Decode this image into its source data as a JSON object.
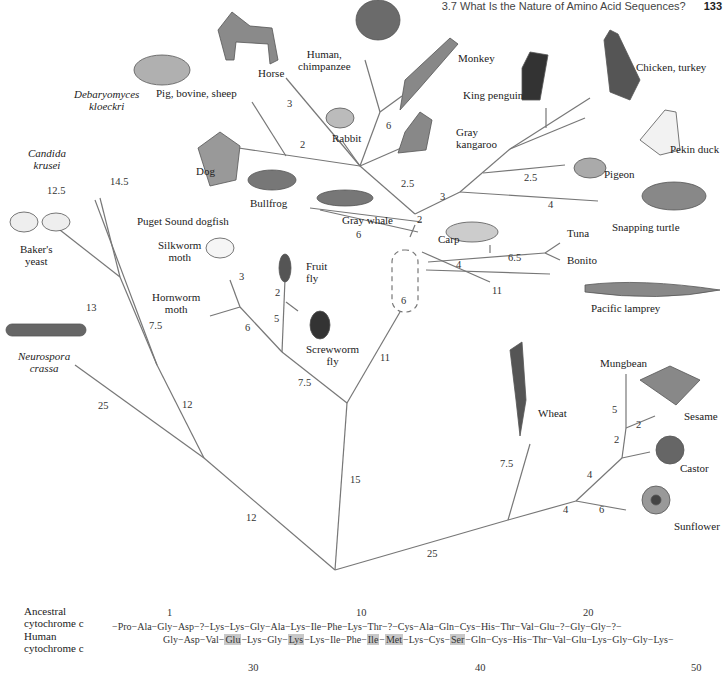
{
  "header": {
    "section": "3.7  What Is the Nature of Amino Acid Sequences?",
    "page": "133"
  },
  "organisms": {
    "horse": "Horse",
    "human": "Human,\nchimpanzee",
    "human_l1": "Human,",
    "human_l2": "chimpanzee",
    "monkey": "Monkey",
    "pig": "Pig, bovine, sheep",
    "rabbit": "Rabbit",
    "kangaroo_l1": "Gray",
    "kangaroo_l2": "kangaroo",
    "king_penguin": "King penguin",
    "chicken": "Chicken, turkey",
    "duck": "Pekin duck",
    "pigeon": "Pigeon",
    "turtle": "Snapping turtle",
    "dog": "Dog",
    "bullfrog": "Bullfrog",
    "whale": "Gray whale",
    "dogfish": "Puget Sound dogfish",
    "carp": "Carp",
    "tuna": "Tuna",
    "bonito": "Bonito",
    "lamprey": "Pacific lamprey",
    "silkworm_l1": "Silkworm",
    "silkworm_l2": "moth",
    "fruitfly_l1": "Fruit",
    "fruitfly_l2": "fly",
    "hornworm_l1": "Hornworm",
    "hornworm_l2": "moth",
    "screwworm_l1": "Screwworm",
    "screwworm_l2": "fly",
    "candida_l1": "Candida",
    "candida_l2": "krusei",
    "debaryomyces_l1": "Debaryomyces",
    "debaryomyces_l2": "kloeckri",
    "bakers_l1": "Baker's",
    "bakers_l2": "yeast",
    "neurospora_l1": "Neurospora",
    "neurospora_l2": "crassa",
    "wheat": "Wheat",
    "mungbean": "Mungbean",
    "sesame": "Sesame",
    "castor": "Castor",
    "sunflower": "Sunflower"
  },
  "branch_lengths": {
    "horse": "3",
    "pig_dog": "2",
    "human_monkey": "6",
    "mammal_stem": "2.5",
    "bird_stem": "3",
    "pigeon": "2.5",
    "turtle": "4",
    "amniote": "2",
    "whale_frog": "6",
    "fish": "4",
    "tuna": "6.5",
    "lamprey": "11",
    "vert_core": "6",
    "silkworm": "3",
    "fruitfly": "2",
    "screwworm": "5",
    "hornworm": "6",
    "insect": "7.5",
    "animal": "11",
    "metazoa": "15",
    "candida": "12.5",
    "debaryomyces": "14.5",
    "bakers": "13",
    "yeast_inner": "7.5",
    "yeast_stem": "12",
    "neurospora": "25",
    "fungi": "12",
    "plant": "25",
    "wheat": "7.5",
    "dicot": "4",
    "sunflower": "6",
    "dicot_inner": "4",
    "castor": "2",
    "mungbean": "5",
    "sesame": "2"
  },
  "sequence": {
    "ancestral_label_l1": "Ancestral",
    "ancestral_label_l2": "cytochrome c",
    "human_label_l1": "Human",
    "human_label_l2": "cytochrome c",
    "positions": [
      "1",
      "10",
      "20",
      "30",
      "40",
      "50"
    ],
    "ancestral": [
      "Pro",
      "Ala",
      "Gly",
      "Asp",
      "?",
      "Lys",
      "Lys",
      "Gly",
      "Ala",
      "Lys",
      "Ile",
      "Phe",
      "Lys",
      "Thr",
      "?",
      "Cys",
      "Ala",
      "Gln",
      "Cys",
      "His",
      "Thr",
      "Val",
      "Glu",
      "?",
      "Gly",
      "Gly",
      "?"
    ],
    "human": [
      "Gly",
      "Asp",
      "Val",
      "Glu",
      "Lys",
      "Gly",
      "Lys",
      "Lys",
      "Ile",
      "Phe",
      "Ile",
      "Met",
      "Lys",
      "Cys",
      "Ser",
      "Gln",
      "Cys",
      "His",
      "Thr",
      "Val",
      "Glu",
      "Lys",
      "Gly",
      "Gly",
      "Lys"
    ],
    "highlighted": [
      "Glu",
      "Lys",
      "Ile",
      "Met",
      "Ser"
    ]
  }
}
